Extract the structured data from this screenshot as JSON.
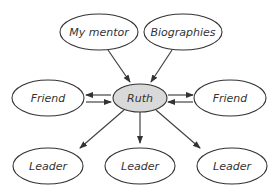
{
  "diagram": {
    "title": "",
    "center": {
      "label": "Ruth",
      "fill": "#d9d9d9"
    },
    "nodes": [
      {
        "id": "mentor",
        "label": "My mentor"
      },
      {
        "id": "bio",
        "label": "Biographies"
      },
      {
        "id": "friend_left",
        "label": "Friend"
      },
      {
        "id": "friend_right",
        "label": "Friend"
      },
      {
        "id": "leader1",
        "label": "Leader"
      },
      {
        "id": "leader2",
        "label": "Leader"
      },
      {
        "id": "leader3",
        "label": "Leader"
      }
    ],
    "edges": [
      {
        "from": "My mentor",
        "to": "Ruth"
      },
      {
        "from": "Biographies",
        "to": "Ruth"
      },
      {
        "from": "Ruth",
        "to": "Friend (left)",
        "bidirectional": true
      },
      {
        "from": "Ruth",
        "to": "Friend (right)",
        "bidirectional": true
      },
      {
        "from": "Ruth",
        "to": "Leader (left)"
      },
      {
        "from": "Ruth",
        "to": "Leader (middle)"
      },
      {
        "from": "Ruth",
        "to": "Leader (right)"
      }
    ]
  }
}
